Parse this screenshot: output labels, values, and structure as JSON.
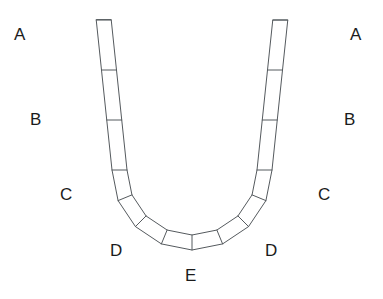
{
  "figure": {
    "type": "geometry-diagram",
    "background_color": "#ffffff",
    "stroke_color": "#555a5e",
    "label_color": "#1b1b1b",
    "segment_fill": "#ffffff",
    "segment_count": 13,
    "labels": [
      {
        "id": "label-a-left",
        "text": "A",
        "x": 14,
        "y": 26,
        "side": "left",
        "joint": "A"
      },
      {
        "id": "label-a-right",
        "text": "A",
        "x": 350,
        "y": 26,
        "side": "right",
        "joint": "A"
      },
      {
        "id": "label-b-left",
        "text": "B",
        "x": 30,
        "y": 111,
        "side": "left",
        "joint": "B"
      },
      {
        "id": "label-b-right",
        "text": "B",
        "x": 344,
        "y": 111,
        "side": "right",
        "joint": "B"
      },
      {
        "id": "label-c-left",
        "text": "C",
        "x": 60,
        "y": 186,
        "side": "left",
        "joint": "C"
      },
      {
        "id": "label-c-right",
        "text": "C",
        "x": 318,
        "y": 186,
        "side": "right",
        "joint": "C"
      },
      {
        "id": "label-d-left",
        "text": "D",
        "x": 110,
        "y": 242,
        "side": "left",
        "joint": "D"
      },
      {
        "id": "label-d-right",
        "text": "D",
        "x": 265,
        "y": 242,
        "side": "right",
        "joint": "D"
      },
      {
        "id": "label-e-center",
        "text": "E",
        "x": 185,
        "y": 267,
        "side": "center",
        "joint": "E"
      }
    ],
    "geometry": {
      "center_x": 192,
      "center_y": 170,
      "outer_radius": 80,
      "inner_radius": 65,
      "arm_top_y": 20,
      "left_arm_tilt": 6,
      "right_arm_tilt": 6,
      "segments_per_side": 6,
      "keystone_at_bottom": true
    }
  }
}
